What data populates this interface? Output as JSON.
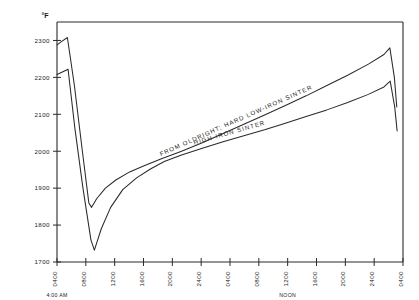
{
  "chart_data": {
    "type": "line",
    "title": "",
    "xlabel": "",
    "ylabel": "°F",
    "ylim": [
      1700,
      2350
    ],
    "yticks": [
      1700,
      1800,
      1900,
      2000,
      2100,
      2200,
      2300
    ],
    "ytick_labels": [
      "1700",
      "1800",
      "1900",
      "2000",
      "2100",
      "2200",
      "2300"
    ],
    "grid": false,
    "legend_position": "inline-on-curve",
    "x_tick_labels": [
      "0400",
      "0800",
      "1200",
      "1600",
      "2000",
      "2400",
      "0400",
      "0800",
      "1200",
      "1600",
      "2000",
      "2400",
      "0400"
    ],
    "annotations": [
      {
        "text": "4:00 AM",
        "at_tick": "0400",
        "tick_index": 0
      },
      {
        "text": "NOON",
        "at_tick": "1200",
        "tick_index": 8
      }
    ],
    "series": [
      {
        "name": "FROM OLDRIGHT; HARD LOW-IRON SINTER",
        "label_x_frac": 0.52,
        "points": [
          {
            "x": 0.0,
            "y": 2288
          },
          {
            "x": 0.012,
            "y": 2296
          },
          {
            "x": 0.03,
            "y": 2308
          },
          {
            "x": 0.05,
            "y": 2180
          },
          {
            "x": 0.072,
            "y": 2010
          },
          {
            "x": 0.092,
            "y": 1860
          },
          {
            "x": 0.1,
            "y": 1848
          },
          {
            "x": 0.115,
            "y": 1872
          },
          {
            "x": 0.14,
            "y": 1900
          },
          {
            "x": 0.17,
            "y": 1922
          },
          {
            "x": 0.21,
            "y": 1944
          },
          {
            "x": 0.25,
            "y": 1960
          },
          {
            "x": 0.3,
            "y": 1979
          },
          {
            "x": 0.36,
            "y": 2000
          },
          {
            "x": 0.42,
            "y": 2023
          },
          {
            "x": 0.48,
            "y": 2048
          },
          {
            "x": 0.54,
            "y": 2073
          },
          {
            "x": 0.6,
            "y": 2098
          },
          {
            "x": 0.66,
            "y": 2124
          },
          {
            "x": 0.72,
            "y": 2150
          },
          {
            "x": 0.78,
            "y": 2178
          },
          {
            "x": 0.84,
            "y": 2206
          },
          {
            "x": 0.9,
            "y": 2236
          },
          {
            "x": 0.945,
            "y": 2262
          },
          {
            "x": 0.962,
            "y": 2280
          },
          {
            "x": 0.975,
            "y": 2200
          },
          {
            "x": 0.982,
            "y": 2120
          }
        ]
      },
      {
        "name": "HIGH-IRON SINTER",
        "label_x_frac": 0.5,
        "points": [
          {
            "x": 0.0,
            "y": 2208
          },
          {
            "x": 0.014,
            "y": 2214
          },
          {
            "x": 0.032,
            "y": 2222
          },
          {
            "x": 0.052,
            "y": 2060
          },
          {
            "x": 0.075,
            "y": 1900
          },
          {
            "x": 0.098,
            "y": 1760
          },
          {
            "x": 0.108,
            "y": 1732
          },
          {
            "x": 0.128,
            "y": 1790
          },
          {
            "x": 0.155,
            "y": 1848
          },
          {
            "x": 0.19,
            "y": 1896
          },
          {
            "x": 0.23,
            "y": 1928
          },
          {
            "x": 0.27,
            "y": 1952
          },
          {
            "x": 0.31,
            "y": 1972
          },
          {
            "x": 0.36,
            "y": 1990
          },
          {
            "x": 0.42,
            "y": 2008
          },
          {
            "x": 0.48,
            "y": 2026
          },
          {
            "x": 0.54,
            "y": 2042
          },
          {
            "x": 0.6,
            "y": 2058
          },
          {
            "x": 0.66,
            "y": 2076
          },
          {
            "x": 0.72,
            "y": 2094
          },
          {
            "x": 0.78,
            "y": 2112
          },
          {
            "x": 0.84,
            "y": 2132
          },
          {
            "x": 0.9,
            "y": 2154
          },
          {
            "x": 0.945,
            "y": 2174
          },
          {
            "x": 0.963,
            "y": 2190
          },
          {
            "x": 0.976,
            "y": 2120
          },
          {
            "x": 0.983,
            "y": 2055
          }
        ]
      }
    ]
  }
}
